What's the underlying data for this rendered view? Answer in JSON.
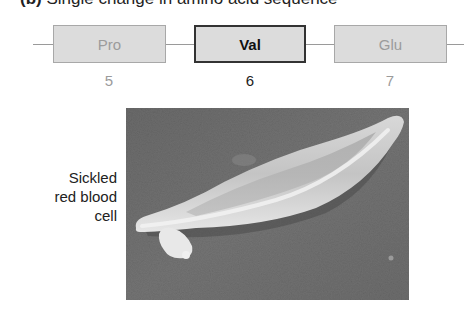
{
  "figure": {
    "title_label": "(b)",
    "title_text": "Single change in amino acid sequence",
    "sequence": [
      {
        "residue": "Pro",
        "position": "5",
        "highlighted": false
      },
      {
        "residue": "Val",
        "position": "6",
        "highlighted": true
      },
      {
        "residue": "Glu",
        "position": "7",
        "highlighted": false
      }
    ],
    "micrograph": {
      "label_lines": [
        "Sickled",
        "red blood",
        "cell"
      ],
      "subject": "sickled-red-blood-cell-sem"
    },
    "colors": {
      "box_fill": "#dcdcdc",
      "dim_text": "#9b9b9b",
      "highlight_border": "#333333",
      "sem_background": "#6e6e6e",
      "cell_fill": "#cfcfcf"
    }
  }
}
